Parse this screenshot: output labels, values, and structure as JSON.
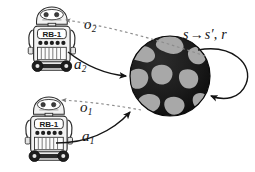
{
  "diagram": {
    "background_color": "#ffffff",
    "ink_color": "#141414",
    "agents": [
      {
        "id": "agent-top",
        "name": "RB-1",
        "display_label": "RB-1",
        "action_label": "a",
        "action_index": "2",
        "observation_label": "o",
        "observation_index": "2"
      },
      {
        "id": "agent-bottom",
        "name": "RB-1",
        "display_label": "RB-1",
        "action_label": "a",
        "action_index": "1",
        "observation_label": "o",
        "observation_index": "1"
      }
    ],
    "environment": {
      "name": "world-globe",
      "fill_color": "#1b1b1b",
      "patch_color": "#a8a8a8",
      "transition": {
        "state": "s",
        "arrow": "→",
        "next_state": "s′",
        "separator": ",",
        "reward": "r",
        "full_text": "s → s′, r"
      }
    },
    "labels": {
      "o2": {
        "symbol": "o",
        "index": "2"
      },
      "a2": {
        "symbol": "a",
        "index": "2"
      },
      "o1": {
        "symbol": "o",
        "index": "1"
      },
      "a1": {
        "symbol": "a",
        "index": "1"
      }
    }
  }
}
